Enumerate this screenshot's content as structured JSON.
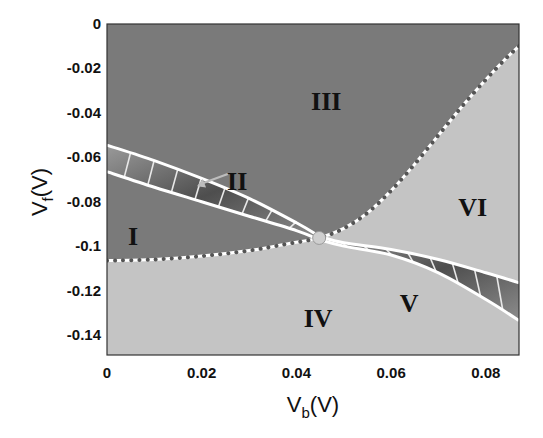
{
  "chart_data": {
    "type": "area",
    "title": "",
    "xlabel": "V_b(V)",
    "ylabel": "V_f(V)",
    "xlabel_main": "V",
    "xlabel_sub": "b",
    "xlabel_tail": "(V)",
    "ylabel_main": "V",
    "ylabel_sub": "f",
    "ylabel_tail": "(V)",
    "xlim": [
      0,
      0.087
    ],
    "ylim": [
      -0.149,
      0
    ],
    "xticks": [
      0,
      0.02,
      0.04,
      0.06,
      0.08
    ],
    "xtick_labels": [
      "0",
      "0.02",
      "0.04",
      "0.06",
      "0.08"
    ],
    "yticks": [
      0,
      -0.02,
      -0.04,
      -0.06,
      -0.08,
      -0.1,
      -0.12,
      -0.14
    ],
    "ytick_labels": [
      "0",
      "-0.02",
      "-0.04",
      "-0.06",
      "-0.08",
      "-0.1",
      "-0.12",
      "-0.14"
    ],
    "grid": false,
    "legend": "none",
    "colors": {
      "dark_region": "#7a7a7a",
      "light_region": "#c4c4c4",
      "band_dark": "#5e5e5e",
      "band_mid": "#8a8a8a",
      "boundary_dot": "#555555",
      "white_line": "#ffffff",
      "crossing_point": "#cfcfcf"
    },
    "crossing_point": {
      "x": 0.0448,
      "y": -0.0963
    },
    "dotted_boundary": {
      "description": "Dotted boundary separating dark regions (I, II, III) from light regions (IV, V, VI)",
      "points": [
        [
          0.0,
          -0.1065
        ],
        [
          0.01,
          -0.106
        ],
        [
          0.02,
          -0.1045
        ],
        [
          0.03,
          -0.102
        ],
        [
          0.038,
          -0.099
        ],
        [
          0.0448,
          -0.0963
        ],
        [
          0.05,
          -0.092
        ],
        [
          0.055,
          -0.085
        ],
        [
          0.06,
          -0.075
        ],
        [
          0.065,
          -0.063
        ],
        [
          0.07,
          -0.05
        ],
        [
          0.075,
          -0.037
        ],
        [
          0.08,
          -0.025
        ],
        [
          0.084,
          -0.016
        ],
        [
          0.087,
          -0.01
        ]
      ]
    },
    "band_II": {
      "description": "Hatched band (region II) between two white boundary lines, left of crossing",
      "upper": [
        [
          0.0,
          -0.0545
        ],
        [
          0.01,
          -0.0615
        ],
        [
          0.02,
          -0.0695
        ],
        [
          0.03,
          -0.0785
        ],
        [
          0.04,
          -0.0895
        ],
        [
          0.0448,
          -0.0955
        ]
      ],
      "lower": [
        [
          0.0,
          -0.0665
        ],
        [
          0.01,
          -0.0735
        ],
        [
          0.02,
          -0.08
        ],
        [
          0.03,
          -0.0865
        ],
        [
          0.04,
          -0.093
        ],
        [
          0.0448,
          -0.097
        ]
      ]
    },
    "band_V": {
      "description": "Hatched band (region V) between two white boundary lines, right of crossing",
      "upper": [
        [
          0.0448,
          -0.0955
        ],
        [
          0.05,
          -0.0985
        ],
        [
          0.06,
          -0.1015
        ],
        [
          0.07,
          -0.106
        ],
        [
          0.08,
          -0.112
        ],
        [
          0.087,
          -0.1165
        ]
      ],
      "lower": [
        [
          0.0448,
          -0.097
        ],
        [
          0.05,
          -0.1
        ],
        [
          0.06,
          -0.104
        ],
        [
          0.07,
          -0.112
        ],
        [
          0.08,
          -0.124
        ],
        [
          0.087,
          -0.1335
        ]
      ]
    },
    "regions": [
      {
        "label": "I",
        "x": 0.0055,
        "y": -0.0955
      },
      {
        "label": "II",
        "x": 0.0275,
        "y": -0.0705
      },
      {
        "label": "III",
        "x": 0.0463,
        "y": -0.0345
      },
      {
        "label": "IV",
        "x": 0.0446,
        "y": -0.1325
      },
      {
        "label": "V",
        "x": 0.0638,
        "y": -0.1255
      },
      {
        "label": "VI",
        "x": 0.0772,
        "y": -0.0825
      }
    ],
    "annotation_arrow": {
      "from": [
        0.0255,
        -0.0675
      ],
      "to": [
        0.019,
        -0.073
      ],
      "label": "II"
    }
  }
}
